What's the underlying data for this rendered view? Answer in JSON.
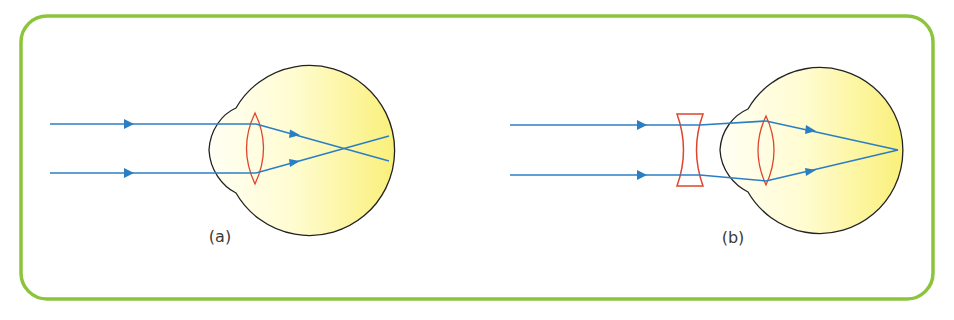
{
  "colors": {
    "frame": "#8cc43c",
    "ray": "#2a7fc4",
    "lens": "#e0442c",
    "eye_outline": "#222222",
    "eye_fill_light": "#fffff0",
    "eye_fill_dark": "#fbf38a",
    "caption": "#3a3a3a"
  },
  "panels": [
    {
      "id": "a",
      "caption": "(a)",
      "description": "Short-sighted eye: parallel rays focus in front of the retina"
    },
    {
      "id": "b",
      "caption": "(b)",
      "description": "Corrected with a diverging (concave) lens: rays focus on the retina"
    }
  ]
}
